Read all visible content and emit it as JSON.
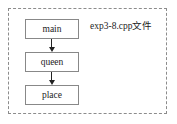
{
  "diagram": {
    "type": "call-graph",
    "module": {
      "label": "exp3-8.cpp文件",
      "border_style": "dashed",
      "border_color": "#8c8c8c"
    },
    "nodes": [
      {
        "id": "main",
        "label": "main"
      },
      {
        "id": "queen",
        "label": "queen"
      },
      {
        "id": "place",
        "label": "place"
      }
    ],
    "edges": [
      {
        "from": "main",
        "to": "queen",
        "direction": "down",
        "arrowhead": "filled-triangle"
      },
      {
        "from": "queen",
        "to": "place",
        "direction": "down",
        "arrowhead": "filled-triangle"
      }
    ],
    "colors": {
      "box_border": "#888888",
      "box_fill": "#ffffff",
      "arrow": "#222222",
      "text": "#1c1c1c",
      "background": "#ffffff"
    }
  }
}
